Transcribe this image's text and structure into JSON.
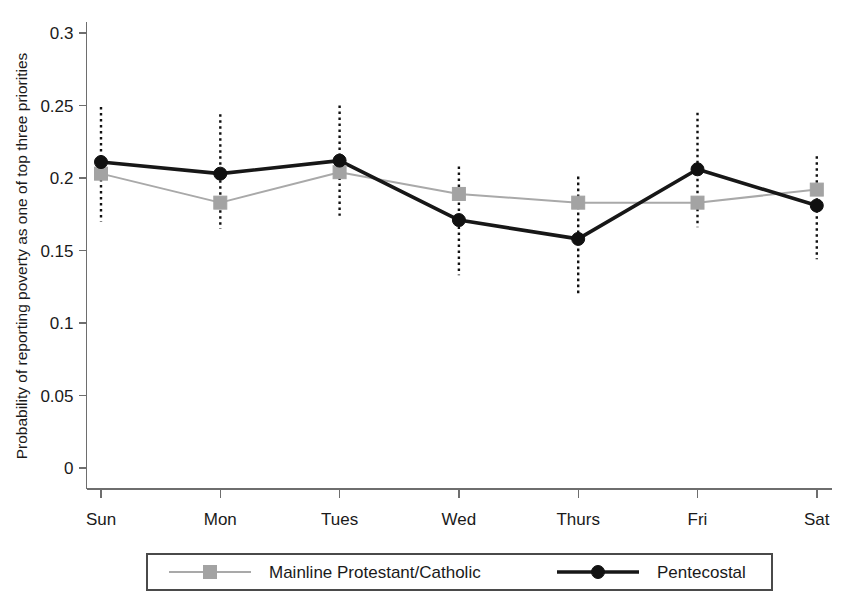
{
  "chart_data": {
    "type": "line",
    "title": "",
    "xlabel": "",
    "ylabel": "Probability of reporting poverty as one of top three priorities",
    "categories": [
      "Sun",
      "Mon",
      "Tues",
      "Wed",
      "Thurs",
      "Fri",
      "Sat"
    ],
    "ylim": [
      0,
      0.3
    ],
    "yticks": [
      0,
      0.05,
      0.1,
      0.15,
      0.2,
      0.25,
      0.3
    ],
    "ytick_labels": [
      "0",
      "0.05",
      "0.1",
      "0.15",
      "0.2",
      "0.25",
      "0.3"
    ],
    "grid": false,
    "legend_position": "bottom",
    "series": [
      {
        "name": "Mainline Protestant/Catholic",
        "marker": "square",
        "color": "#a3a3a3",
        "line_color": "#a9a9a9",
        "values": [
          0.203,
          0.183,
          0.204,
          0.189,
          0.183,
          0.183,
          0.192
        ]
      },
      {
        "name": "Pentecostal",
        "marker": "circle",
        "color": "#111111",
        "line_color": "#171717",
        "values": [
          0.211,
          0.203,
          0.212,
          0.171,
          0.158,
          0.206,
          0.181
        ]
      }
    ],
    "error_bars": {
      "style": "dotted-vertical",
      "color": "#111111",
      "intervals": [
        {
          "category": "Sun",
          "low": 0.17,
          "high": 0.249
        },
        {
          "category": "Mon",
          "low": 0.165,
          "high": 0.244
        },
        {
          "category": "Tues",
          "low": 0.174,
          "high": 0.25
        },
        {
          "category": "Wed",
          "low": 0.133,
          "high": 0.208
        },
        {
          "category": "Thurs",
          "low": 0.12,
          "high": 0.201
        },
        {
          "category": "Fri",
          "low": 0.166,
          "high": 0.245
        },
        {
          "category": "Sat",
          "low": 0.144,
          "high": 0.215
        }
      ]
    }
  },
  "legend": {
    "entries": [
      {
        "label": "Mainline Protestant/Catholic"
      },
      {
        "label": "Pentecostal"
      }
    ]
  }
}
